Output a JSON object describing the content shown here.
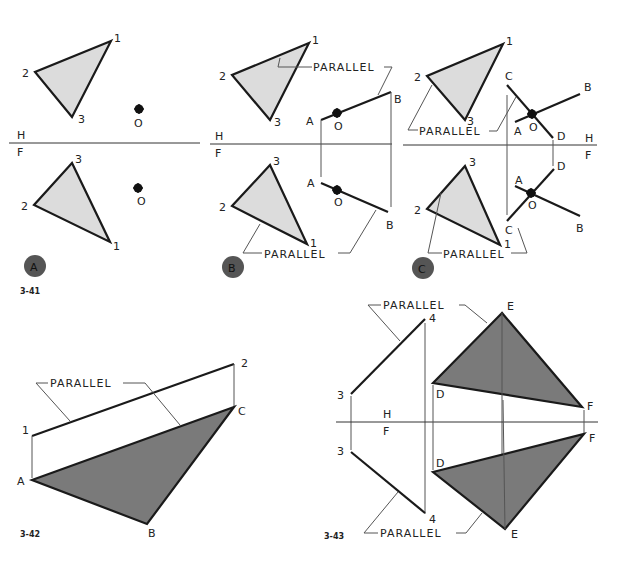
{
  "figures": {
    "fig341": {
      "label": "3-41",
      "panels": [
        {
          "badge": "A"
        },
        {
          "badge": "B"
        },
        {
          "badge": "C"
        }
      ]
    },
    "fig342": {
      "label": "3-42"
    },
    "fig343": {
      "label": "3-43"
    }
  },
  "labels": {
    "parallel": "PARALLEL",
    "h": "H",
    "f": "F",
    "p1": "1",
    "p2": "2",
    "p3": "3",
    "p4": "4",
    "o": "O",
    "a": "A",
    "b": "B",
    "c": "C",
    "d": "D",
    "e": "E",
    "ff": "F"
  },
  "colors": {
    "light_fill": "#dcdcdc",
    "dark_fill": "#7a7a7a",
    "badge_fill": "#555555",
    "line": "#1a1a1a"
  }
}
